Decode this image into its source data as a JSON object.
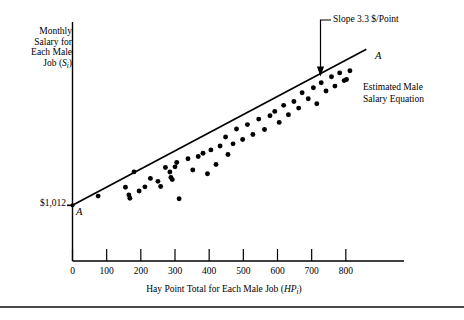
{
  "chart_data": {
    "type": "scatter",
    "title": "",
    "xlabel": "Hay Point Total for Each Male Job (HP_i)",
    "ylabel": "Monthly Salary for Each Male Job (S_i)",
    "xlim": [
      0,
      900
    ],
    "ylim": [
      0,
      4200
    ],
    "xticks": [
      0,
      100,
      200,
      300,
      400,
      500,
      600,
      700,
      800
    ],
    "grid": false,
    "legend_position": "none",
    "series": [
      {
        "name": "Male jobs",
        "x": [
          75,
          155,
          165,
          168,
          180,
          195,
          212,
          228,
          250,
          258,
          272,
          285,
          288,
          292,
          300,
          305,
          312,
          338,
          352,
          368,
          382,
          395,
          405,
          420,
          432,
          448,
          455,
          470,
          480,
          498,
          512,
          528,
          545,
          562,
          578,
          592,
          605,
          618,
          632,
          648,
          662,
          672,
          690,
          705,
          715,
          728,
          742,
          758,
          768,
          782,
          795,
          802,
          812
        ],
        "y": [
          1180,
          1340,
          1200,
          1142,
          1620,
          1272,
          1348,
          1502,
          1448,
          1355,
          1700,
          1618,
          1520,
          1480,
          1712,
          1790,
          1132,
          1860,
          1655,
          1900,
          1960,
          1585,
          2020,
          1755,
          2090,
          2255,
          1935,
          2130,
          2400,
          2210,
          2480,
          2300,
          2580,
          2390,
          2640,
          2720,
          2520,
          2830,
          2660,
          2900,
          2780,
          3060,
          2950,
          3150,
          2860,
          3240,
          3090,
          3350,
          3180,
          3420,
          3280,
          3300,
          3460
        ]
      }
    ],
    "regression_line": {
      "label": "A",
      "name": "Estimated Male Salary Equation",
      "intercept_label": "$1,012",
      "intercept_value": 1012,
      "slope_label": "Slope 3.3 $/Point",
      "slope_value": 3.3,
      "x_start": 0,
      "x_end": 860
    },
    "annotations": [
      {
        "name": "slope-annotation",
        "text": "Slope 3.3 $/Point"
      },
      {
        "name": "line-label-upper",
        "text": "A"
      },
      {
        "name": "line-label-lower",
        "text": "A"
      },
      {
        "name": "equation-annotation",
        "text": "Estimated Male\nSalary Equation"
      },
      {
        "name": "intercept-annotation",
        "text": "$1,012"
      }
    ]
  },
  "axes": {
    "ylabel_lines": [
      "Monthly",
      "Salary for",
      "Each Male",
      "Job (S",
      "i",
      ")"
    ],
    "ylabel_text": "Monthly Salary for Each Male Job (S",
    "ylabel_sub": "i",
    "ylabel_tail": ")",
    "xlabel_text": "Hay Point Total for Each Male Job (HP",
    "xlabel_sub": "i",
    "xlabel_tail": ")",
    "xtick_labels": [
      "0",
      "100",
      "200",
      "300",
      "400",
      "500",
      "600",
      "700",
      "800"
    ]
  },
  "annotations": {
    "slope": "Slope 3.3 $/Point",
    "equation_line1": "Estimated Male",
    "equation_line2": "Salary Equation",
    "intercept": "$1,012",
    "line_label_upper": "A",
    "line_label_lower": "A"
  },
  "colors": {
    "ink": "#000000",
    "rule": "#4a4a4a",
    "background": "#ffffff"
  }
}
